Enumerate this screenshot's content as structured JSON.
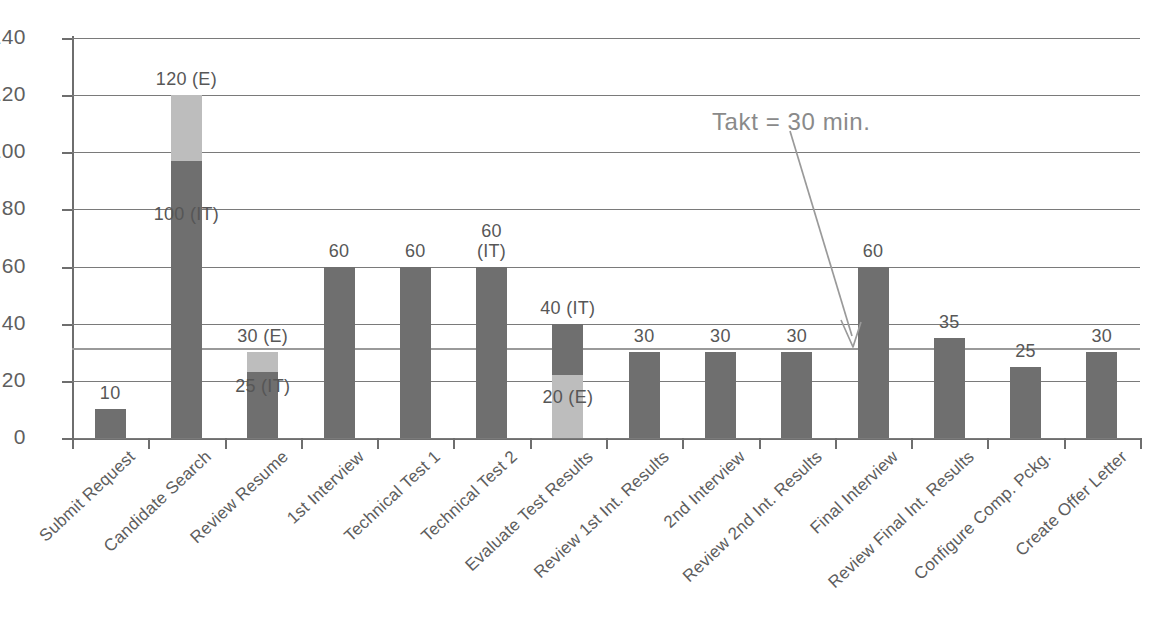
{
  "chart_data": {
    "type": "bar",
    "title": "",
    "xlabel": "",
    "ylabel": "",
    "ylim": [
      0,
      140
    ],
    "ytick_step": 20,
    "yticks": [
      "0",
      "20",
      "40",
      "60",
      "80",
      "100",
      "120",
      "140"
    ],
    "grid": true,
    "legend": null,
    "stacked": true,
    "categories": [
      "Submit Request",
      "Candidate Search",
      "Review Resume",
      "1st Interview",
      "Technical Test 1",
      "Technical Test 2",
      "Evaluate Test Results",
      "Review 1st Int. Results",
      "2nd Interview",
      "Review 2nd Int. Results",
      "Final Interview",
      "Review Final Int. Results",
      "Configure Comp. Pckg.",
      "Create Offer Letter"
    ],
    "series": [
      {
        "name": "IT",
        "color": "#6f6f6f",
        "values": [
          10,
          100,
          25,
          60,
          60,
          60,
          40,
          30,
          30,
          30,
          60,
          35,
          25,
          30
        ]
      },
      {
        "name": "E",
        "color": "#bdbdbd",
        "values": [
          0,
          20,
          5,
          0,
          0,
          0,
          20,
          0,
          0,
          0,
          0,
          0,
          0,
          0
        ]
      }
    ],
    "totals": [
      10,
      120,
      30,
      60,
      60,
      60,
      40,
      30,
      30,
      30,
      60,
      35,
      25,
      30
    ],
    "bars": [
      {
        "category": "Submit Request",
        "total": 10,
        "top_label": "10",
        "inner_label": "",
        "segments": [
          {
            "series": "IT",
            "from": 0,
            "to": 10,
            "color": "#6f6f6f"
          }
        ]
      },
      {
        "category": "Candidate Search",
        "total": 120,
        "top_label": "120 (E)",
        "inner_label": "100 (IT)",
        "segments": [
          {
            "series": "IT",
            "from": 0,
            "to": 97,
            "color": "#6f6f6f"
          },
          {
            "series": "E",
            "from": 97,
            "to": 120,
            "color": "#bdbdbd"
          }
        ]
      },
      {
        "category": "Review Resume",
        "total": 30,
        "top_label": "30 (E)",
        "inner_label": "25 (IT)",
        "segments": [
          {
            "series": "IT",
            "from": 0,
            "to": 23,
            "color": "#6f6f6f"
          },
          {
            "series": "E",
            "from": 23,
            "to": 30,
            "color": "#bdbdbd"
          }
        ]
      },
      {
        "category": "1st Interview",
        "total": 60,
        "top_label": "60",
        "inner_label": "",
        "segments": [
          {
            "series": "IT",
            "from": 0,
            "to": 60,
            "color": "#6f6f6f"
          }
        ]
      },
      {
        "category": "Technical Test 1",
        "total": 60,
        "top_label": "60",
        "inner_label": "",
        "segments": [
          {
            "series": "IT",
            "from": 0,
            "to": 60,
            "color": "#6f6f6f"
          }
        ]
      },
      {
        "category": "Technical Test 2",
        "total": 60,
        "top_label": "60\n(IT)",
        "inner_label": "",
        "segments": [
          {
            "series": "IT",
            "from": 0,
            "to": 60,
            "color": "#6f6f6f"
          }
        ]
      },
      {
        "category": "Evaluate Test Results",
        "total": 40,
        "top_label": "40 (IT)",
        "inner_label": "20 (E)",
        "segments": [
          {
            "series": "E",
            "from": 0,
            "to": 22,
            "color": "#bdbdbd"
          },
          {
            "series": "IT",
            "from": 22,
            "to": 40,
            "color": "#6f6f6f"
          }
        ]
      },
      {
        "category": "Review 1st Int. Results",
        "total": 30,
        "top_label": "30",
        "inner_label": "",
        "segments": [
          {
            "series": "IT",
            "from": 0,
            "to": 30,
            "color": "#6f6f6f"
          }
        ]
      },
      {
        "category": "2nd Interview",
        "total": 30,
        "top_label": "30",
        "inner_label": "",
        "segments": [
          {
            "series": "IT",
            "from": 0,
            "to": 30,
            "color": "#6f6f6f"
          }
        ]
      },
      {
        "category": "Review 2nd Int. Results",
        "total": 30,
        "top_label": "30",
        "inner_label": "",
        "segments": [
          {
            "series": "IT",
            "from": 0,
            "to": 30,
            "color": "#6f6f6f"
          }
        ]
      },
      {
        "category": "Final Interview",
        "total": 60,
        "top_label": "60",
        "inner_label": "",
        "segments": [
          {
            "series": "IT",
            "from": 0,
            "to": 60,
            "color": "#6f6f6f"
          }
        ]
      },
      {
        "category": "Review Final Int. Results",
        "total": 35,
        "top_label": "35",
        "inner_label": "",
        "segments": [
          {
            "series": "IT",
            "from": 0,
            "to": 35,
            "color": "#6f6f6f"
          }
        ]
      },
      {
        "category": "Configure Comp. Pckg.",
        "total": 25,
        "top_label": "25",
        "inner_label": "",
        "segments": [
          {
            "series": "IT",
            "from": 0,
            "to": 25,
            "color": "#6f6f6f"
          }
        ]
      },
      {
        "category": "Create Offer Letter",
        "total": 30,
        "top_label": "30",
        "inner_label": "",
        "segments": [
          {
            "series": "IT",
            "from": 0,
            "to": 30,
            "color": "#6f6f6f"
          }
        ]
      }
    ],
    "annotations": [
      {
        "name": "takt-line",
        "text": "Takt = 30 min.",
        "value": 30,
        "color": "#8a8a8a",
        "type": "reference-line-with-arrow"
      }
    ]
  },
  "colors": {
    "bar_it": "#6f6f6f",
    "bar_e": "#bdbdbd",
    "axis": "#6e6e6e",
    "grid": "#7a7a7a",
    "takt": "#9a9a9a",
    "text": "#5a5a5a"
  },
  "caption": {
    "text": ""
  }
}
